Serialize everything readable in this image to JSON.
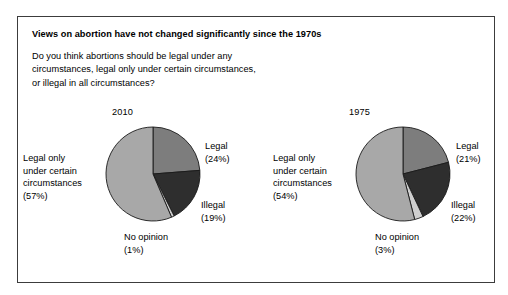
{
  "panel": {
    "title": "Views on abortion have not changed significantly since the 1970s",
    "question": "Do you think abortions should be legal under any circumstances, legal only under certain circumstances, or illegal in all circumstances?"
  },
  "colors": {
    "legal": "#7d7d7d",
    "illegal": "#2e2e2e",
    "no_opinion": "#cfcfcf",
    "legal_only": "#a8a8a8",
    "slice_outline": "#1a1a1a",
    "panel_border": "#3c3c3c",
    "background": "#ffffff",
    "text": "#000000"
  },
  "chart_data": [
    {
      "type": "pie",
      "title": "2010",
      "categories": [
        "Legal",
        "Illegal",
        "No opinion",
        "Legal only under certain circumstances"
      ],
      "values": [
        24,
        19,
        1,
        57
      ],
      "labels": {
        "legal": "Legal\n(24%)",
        "illegal": "Illegal\n(19%)",
        "no_opinion": "No opinion\n(1%)",
        "legal_only": "Legal only\nunder certain\ncircumstances\n(57%)"
      },
      "legend": "none",
      "start_angle_deg": 0
    },
    {
      "type": "pie",
      "title": "1975",
      "categories": [
        "Legal",
        "Illegal",
        "No opinion",
        "Legal only under certain circumstances"
      ],
      "values": [
        21,
        22,
        3,
        54
      ],
      "labels": {
        "legal": "Legal\n(21%)",
        "illegal": "Illegal\n(22%)",
        "no_opinion": "No opinion\n(3%)",
        "legal_only": "Legal only\nunder certain\ncircumstances\n(54%)"
      },
      "legend": "none",
      "start_angle_deg": 0
    }
  ]
}
